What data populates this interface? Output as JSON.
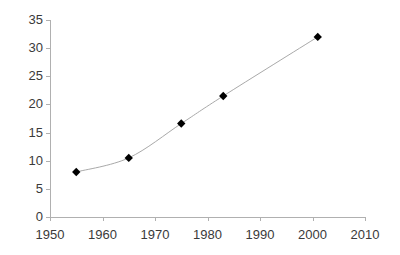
{
  "chart_data": {
    "type": "line",
    "title": "",
    "xlabel": "",
    "ylabel": "",
    "xlim": [
      1950,
      2010
    ],
    "ylim": [
      0,
      35
    ],
    "xticks": [
      1950,
      1960,
      1970,
      1980,
      1990,
      2000,
      2010
    ],
    "xtick_labels": [
      "1950",
      "1960",
      "1970",
      "1980",
      "1990",
      "2000",
      "2010"
    ],
    "yticks": [
      0,
      5,
      10,
      15,
      20,
      25,
      30,
      35
    ],
    "ytick_labels": [
      "0",
      "5",
      "10",
      "15",
      "20",
      "25",
      "30",
      "35"
    ],
    "grid": false,
    "legend": false,
    "legend_position": "none",
    "marker": "diamond",
    "marker_color": "#000000",
    "line_color": "#a9a9a9",
    "axis_color": "#b0b0b0",
    "tick_label_color": "#3a3a3a",
    "x": [
      1955,
      1965,
      1975,
      1983,
      2001
    ],
    "values": [
      8.0,
      10.5,
      16.6,
      21.5,
      32.0
    ],
    "series": [
      {
        "name": "series-1",
        "x": [
          1955,
          1965,
          1975,
          1983,
          2001
        ],
        "values": [
          8.0,
          10.5,
          16.6,
          21.5,
          32.0
        ]
      }
    ],
    "points": [
      {
        "x": 1955,
        "y": 8.0
      },
      {
        "x": 1965,
        "y": 10.5
      },
      {
        "x": 1975,
        "y": 16.6
      },
      {
        "x": 1983,
        "y": 21.5
      },
      {
        "x": 2001,
        "y": 32.0
      }
    ]
  }
}
